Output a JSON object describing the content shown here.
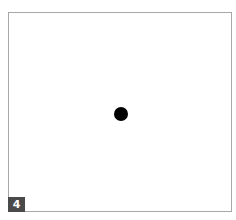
{
  "panel": {
    "label": "4",
    "colors": {
      "border": "#a8a8a8",
      "background": "#ffffff",
      "dot": "#000000",
      "label_background": "#4a4a4a",
      "label_text": "#ffffff"
    }
  },
  "stimulus": {
    "shape": "circle",
    "fill": "black",
    "position": "center"
  }
}
